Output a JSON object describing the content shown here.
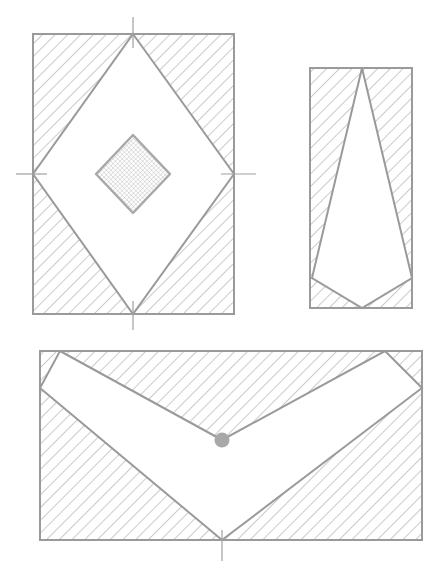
{
  "canvas": {
    "width": 440,
    "height": 569,
    "background_color": "#ffffff",
    "title": "Three hatched cross-section figures"
  },
  "style": {
    "line_color": "#9a9a9a",
    "line_color_dark": "#8c8c8c",
    "hatch_color": "#b3b3b3",
    "dot_fill_color": "#a8a8a8",
    "marker_color": "#a0a0a0",
    "stroke_width": 2.0,
    "thin_stroke_width": 1.0,
    "hatch_spacing": 9,
    "hatch_angle_deg": 45,
    "crosshatch_spacing": 3
  },
  "figures": [
    {
      "id": "figure-top-left",
      "name": "rectangle-with-diamond-void",
      "outline": {
        "type": "rect",
        "x": 33,
        "y": 34,
        "width": 201,
        "height": 280,
        "fill": "hatched-45"
      },
      "void_polygon": {
        "type": "diamond",
        "points": [
          [
            133,
            34
          ],
          [
            234,
            174
          ],
          [
            133,
            314
          ],
          [
            33,
            174
          ]
        ],
        "fill": "white"
      },
      "inner_shape": {
        "type": "diamond",
        "points": [
          [
            133,
            135
          ],
          [
            170,
            174
          ],
          [
            133,
            213
          ],
          [
            96,
            174
          ]
        ],
        "fill": "crosshatch-dotted"
      },
      "center_marks": [
        {
          "name": "top-tick",
          "orientation": "vertical",
          "x1": 133,
          "y1": 17,
          "x2": 133,
          "y2": 48
        },
        {
          "name": "bottom-tick",
          "orientation": "vertical",
          "x1": 133,
          "y1": 301,
          "x2": 133,
          "y2": 330
        },
        {
          "name": "left-tick",
          "orientation": "horizontal",
          "x1": 16,
          "y1": 174,
          "x2": 47,
          "y2": 174
        },
        {
          "name": "right-tick",
          "orientation": "horizontal",
          "x1": 221,
          "y1": 174,
          "x2": 256,
          "y2": 174
        }
      ]
    },
    {
      "id": "figure-top-right",
      "name": "narrow-rectangle-with-tapered-void",
      "outline": {
        "type": "rect",
        "x": 310,
        "y": 68,
        "width": 102,
        "height": 240,
        "fill": "hatched-45"
      },
      "void_polygon": {
        "type": "kite",
        "points": [
          [
            362,
            68
          ],
          [
            412,
            278
          ],
          [
            362,
            308
          ],
          [
            312,
            278
          ]
        ],
        "fill": "white"
      },
      "center_marks": []
    },
    {
      "id": "figure-bottom",
      "name": "wide-rectangle-with-chevron-void",
      "outline": {
        "type": "rect",
        "x": 40,
        "y": 351,
        "width": 382,
        "height": 189,
        "fill": "hatched-45"
      },
      "void_polygon": {
        "type": "chevron",
        "points": [
          [
            60,
            351
          ],
          [
            222,
            440
          ],
          [
            385,
            351
          ],
          [
            422,
            388
          ],
          [
            222,
            540
          ],
          [
            40,
            388
          ]
        ],
        "fill": "white"
      },
      "vertex_dot": {
        "name": "inner-vertex-dot",
        "cx": 222,
        "cy": 440,
        "r": 7.5
      },
      "center_marks": [
        {
          "name": "bottom-tick",
          "orientation": "vertical",
          "x1": 222,
          "y1": 530,
          "x2": 222,
          "y2": 561
        }
      ]
    }
  ]
}
